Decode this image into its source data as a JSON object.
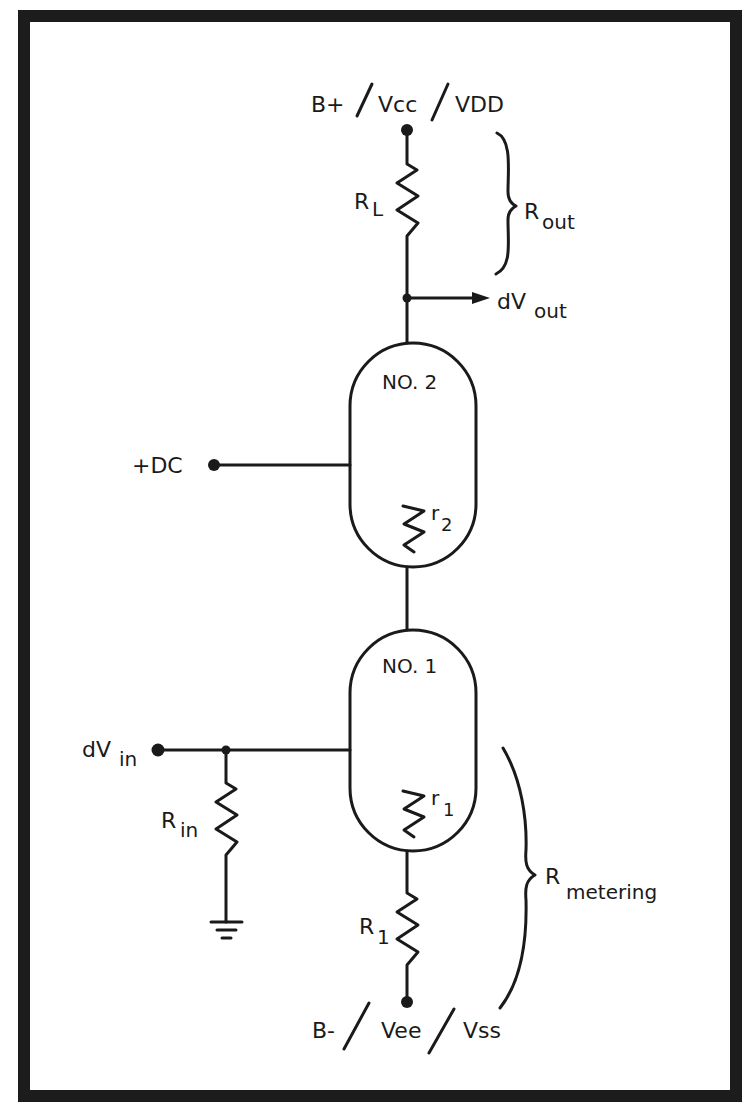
{
  "diagram": {
    "type": "circuit-schematic",
    "supply_top": {
      "label_1": "B+",
      "label_2": "Vcc",
      "label_3": "VDD",
      "separator": "/"
    },
    "supply_bottom": {
      "label_1": "B-",
      "label_2": "Vee",
      "label_3": "Vss",
      "separator": "/"
    },
    "load_resistor": {
      "main": "R",
      "sub": "L"
    },
    "output_resistance": {
      "main": "R",
      "sub": "out"
    },
    "output_signal": {
      "main": "dV",
      "sub": "out"
    },
    "bias_input": {
      "label": "+DC"
    },
    "device_2": {
      "label": "NO. 2",
      "internal_resistor": {
        "main": "r",
        "sub": "2"
      }
    },
    "device_1": {
      "label": "NO. 1",
      "internal_resistor": {
        "main": "r",
        "sub": "1"
      }
    },
    "input_signal": {
      "main": "dV",
      "sub": "in"
    },
    "input_resistor": {
      "main": "R",
      "sub": "in"
    },
    "metering_resistor": {
      "main": "R",
      "sub": "1"
    },
    "metering_resistance": {
      "main": "R",
      "sub": "metering"
    },
    "ground": {
      "symbol": "ground"
    }
  }
}
